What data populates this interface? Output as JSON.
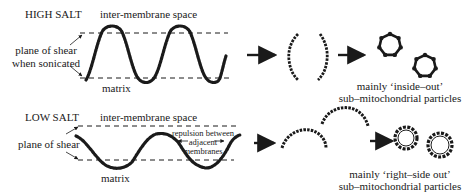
{
  "panels": {
    "high_salt": {
      "condition": "HIGH SALT",
      "top_label": "inter-membrane space",
      "bottom_label": "matrix",
      "shear_label_line1": "plane of shear",
      "shear_label_line2": "when sonicated",
      "result_line1": "mainly ‘inside–out’",
      "result_line2": "sub–mitochondrial particles"
    },
    "low_salt": {
      "condition": "LOW SALT",
      "top_label": "inter-membrane space",
      "bottom_label": "matrix",
      "shear_label": "plane of shear",
      "repulsion_line1": "repulsion between",
      "repulsion_line2": "adjacent",
      "repulsion_line3": "membranes",
      "result_line1": "mainly ‘right–side out’",
      "result_line2": "sub–mitochondrial particles"
    }
  },
  "colors": {
    "ink": "#1a1a1a",
    "background": "#ffffff"
  },
  "icons": {
    "process_arrow": "right-arrow",
    "vesicle": "circle-with-bumps"
  }
}
